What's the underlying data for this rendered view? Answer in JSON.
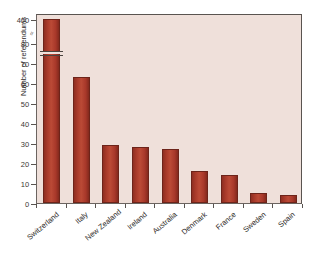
{
  "chart_data": {
    "type": "bar",
    "title": "",
    "subtitle": "",
    "xlabel": "",
    "ylabel": "Number of referendums",
    "categories": [
      "Switzerland",
      "Italy",
      "New Zealand",
      "Ireland",
      "Australia",
      "Denmark",
      "France",
      "Sweden",
      "Spain"
    ],
    "values": [
      400,
      63,
      29,
      28,
      27,
      16,
      14,
      5,
      4
    ],
    "ylim": [
      0,
      80
    ],
    "y_ticks": [
      "0",
      "10",
      "20",
      "30",
      "40",
      "50",
      "60",
      "70",
      "80",
      "400"
    ],
    "y_tick_values": [
      0,
      10,
      20,
      30,
      40,
      50,
      60,
      70,
      80,
      400
    ],
    "axis_break": true,
    "axis_break_note": "y-axis is broken between 80 and 400",
    "grid": false,
    "legend": "none",
    "bar_color": "#a8382a",
    "plot_background": "#efe0da",
    "figure_background": "#ffffff",
    "axis_color": "#5a5450"
  },
  "axis": {
    "y_title": "Number of referendums",
    "break_glyph": "≈"
  }
}
